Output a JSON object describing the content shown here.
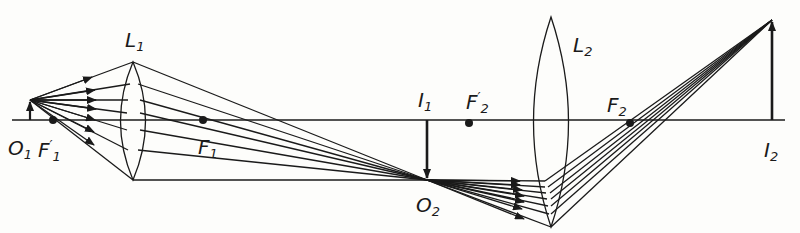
{
  "diagram": {
    "type": "compound-microscope-ray-diagram",
    "colors": {
      "ink": "#1a1a1a",
      "background": "#fdfdfb"
    },
    "labels": {
      "L1": {
        "main": "L",
        "sub": "1"
      },
      "L2": {
        "main": "L",
        "sub": "2"
      },
      "O1": {
        "main": "O",
        "sub": "1"
      },
      "F1prime": {
        "main": "F",
        "sub": "1",
        "sup": "′"
      },
      "F1": {
        "main": "F",
        "sub": "1"
      },
      "I1": {
        "main": "I",
        "sub": "1"
      },
      "F2prime": {
        "main": "F",
        "sub": "2",
        "sup": "′"
      },
      "F2": {
        "main": "F",
        "sub": "2"
      },
      "O2": {
        "main": "O",
        "sub": "2"
      },
      "I2": {
        "main": "I",
        "sub": "2"
      }
    }
  }
}
